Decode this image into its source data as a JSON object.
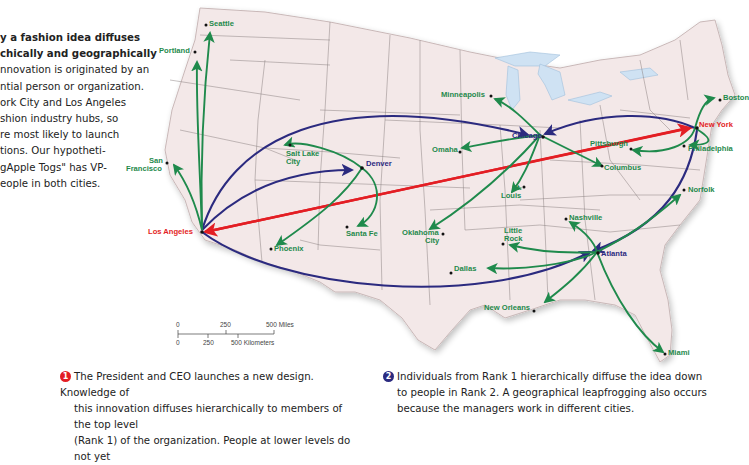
{
  "intro": {
    "title_line1": "y a fashion idea diffuses",
    "title_line2": "chically and geographically",
    "body_lines": [
      "nnovation is originated by an",
      "ntial person or organization.",
      "ork City and Los Angeles",
      "shion industry hubs, so",
      "re most likely to launch",
      "tions. Our hypotheti-",
      "gApple Togs\" has VP-",
      "eople in both cities."
    ]
  },
  "colors": {
    "rank0_red": "#e31e24",
    "rank1_blue": "#2b2a7f",
    "rank2_green": "#1f8a4c",
    "land": "#f3e8e8",
    "water": "#cfe2f3",
    "border": "#777777"
  },
  "cities": {
    "new_york": "New York",
    "los_angeles": "Los Angeles",
    "chicago": "Chicago",
    "denver": "Denver",
    "atlanta": "Atlanta",
    "seattle": "Seattle",
    "portland": "Portland",
    "san_francisco_1": "San",
    "san_francisco_2": "Francisco",
    "salt_lake_1": "Salt Lake",
    "salt_lake_2": "City",
    "phoenix": "Phoenix",
    "santa_fe": "Santa Fe",
    "minneapolis": "Minneapolis",
    "omaha": "Omaha",
    "st_louis_1": "St.",
    "st_louis_2": "Louis",
    "oklahoma_1": "Oklahoma",
    "oklahoma_2": "City",
    "pittsburgh": "Pittsburgh",
    "columbus": "Columbus",
    "philadelphia": "Philadelphia",
    "boston": "Boston",
    "norfolk": "Norfolk",
    "nashville": "Nashville",
    "little_rock_1": "Little",
    "little_rock_2": "Rock",
    "dallas": "Dallas",
    "new_orleans": "New Orleans",
    "miami": "Miami"
  },
  "scale_bar": {
    "miles_ticks": [
      "0",
      "250",
      "500 Miles"
    ],
    "km_ticks": [
      "0",
      "250",
      "500 Kilometers"
    ]
  },
  "steps": [
    {
      "number": "1",
      "color": "#e31e24",
      "lines": [
        "The President and CEO launches a new design. Knowledge of",
        "this innovation diffuses hierarchically to members of the top level",
        "(Rank 1) of the organization. People at lower levels do not yet"
      ]
    },
    {
      "number": "2",
      "color": "#2b2a7f",
      "lines": [
        "Individuals from Rank 1 hierarchically diffuse the idea down",
        "to people in Rank 2. A geographical leapfrogging also occurs",
        "because the managers work in different cities."
      ]
    }
  ]
}
